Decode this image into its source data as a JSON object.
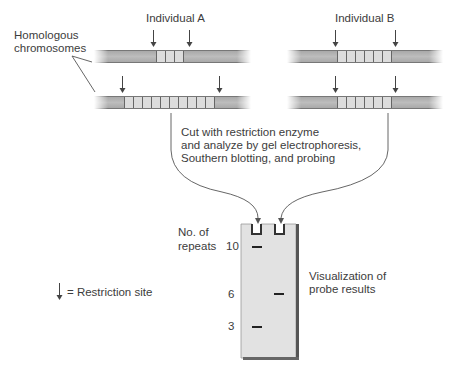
{
  "labels": {
    "individual_a": "Individual A",
    "individual_b": "Individual B",
    "homologous_line1": "Homologous",
    "homologous_line2": "chromosomes",
    "process_line1": "Cut with restriction enzyme",
    "process_line2": "and analyze by gel electrophoresis,",
    "process_line3": "Southern blotting, and probing",
    "repeats_line1": "No. of",
    "repeats_line2": "repeats",
    "visualization_line1": "Visualization of",
    "visualization_line2": "probe results",
    "legend": "= Restriction site"
  },
  "individuals": [
    {
      "name": "Individual A",
      "chromosomes": [
        {
          "repeats": 3
        },
        {
          "repeats": 10
        }
      ]
    },
    {
      "name": "Individual B",
      "chromosomes": [
        {
          "repeats": 6
        },
        {
          "repeats": 6
        }
      ]
    }
  ],
  "gel": {
    "lanes": [
      {
        "individual": "A",
        "bands": [
          10,
          3
        ]
      },
      {
        "individual": "B",
        "bands": [
          6
        ]
      }
    ],
    "scale_marks": [
      {
        "value": "10"
      },
      {
        "value": "6"
      },
      {
        "value": "3"
      }
    ]
  },
  "icons": {
    "restriction_site": "down-arrow"
  }
}
